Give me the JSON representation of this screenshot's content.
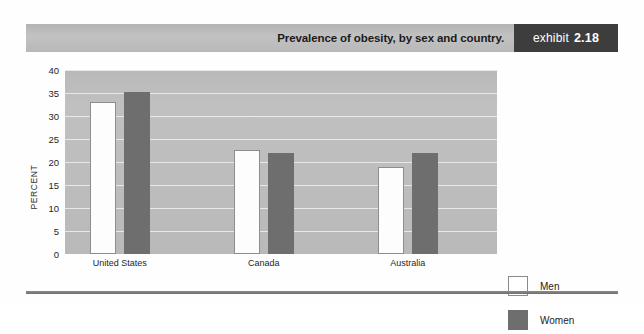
{
  "header": {
    "title": "Prevalence of obesity, by sex and country.",
    "exhibit_word": "exhibit",
    "exhibit_number": "2.18"
  },
  "legend": {
    "items": [
      {
        "label": "Men",
        "swatch": "white-square-icon",
        "color": "#ffffff"
      },
      {
        "label": "Women",
        "swatch": "gray-square-icon",
        "color": "#6e6e6e"
      }
    ]
  },
  "colors": {
    "plot_background": "#bdbdbd",
    "gridline": "#e8e8e8",
    "men_bar": "#ffffff",
    "women_bar": "#6e6e6e",
    "exhibit_tag": "#3d3d3d",
    "header_bar": "#bcbcbc"
  },
  "chart_data": {
    "type": "bar",
    "title": "Prevalence of obesity, by sex and country.",
    "xlabel": "",
    "ylabel": "PERCENT",
    "ylim": [
      0,
      40
    ],
    "ytick_step": 5,
    "yticks": [
      40,
      35,
      30,
      25,
      20,
      15,
      10,
      5,
      0
    ],
    "ytick_labels": [
      "40",
      "35",
      "30",
      "25",
      "20",
      "15",
      "10",
      "5",
      "0"
    ],
    "grid": true,
    "legend_position": "right",
    "categories": [
      "United States",
      "Canada",
      "Australia"
    ],
    "series": [
      {
        "name": "Men",
        "values": [
          33.0,
          22.7,
          19.0
        ]
      },
      {
        "name": "Women",
        "values": [
          35.3,
          22.0,
          22.0
        ]
      }
    ]
  }
}
